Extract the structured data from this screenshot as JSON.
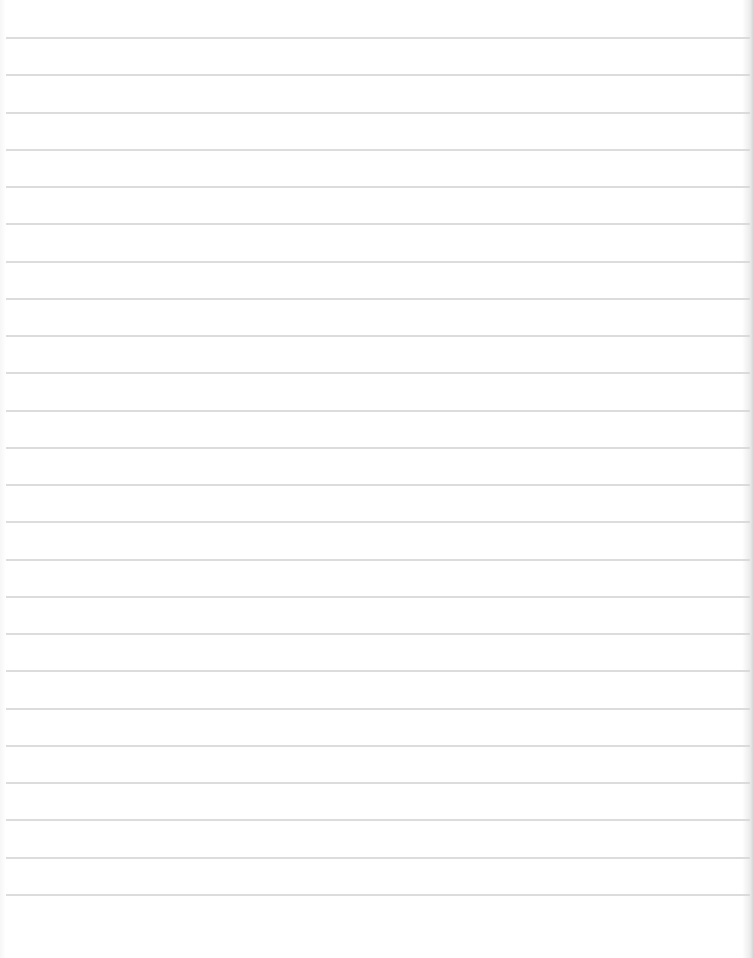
{
  "paper": {
    "type": "ruled-sheet",
    "background_color": "#ffffff",
    "rule_color": "#d6d6d6",
    "rule_count": 24,
    "first_rule_y": 37,
    "rule_spacing": 37.25
  }
}
